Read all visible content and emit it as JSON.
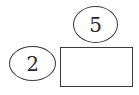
{
  "diagram": {
    "nodes": [
      {
        "id": "top",
        "shape": "ellipse",
        "label": "5"
      },
      {
        "id": "left",
        "shape": "ellipse",
        "label": "2"
      },
      {
        "id": "box",
        "shape": "rectangle",
        "label": ""
      }
    ],
    "stroke_color": "#3a3a3a",
    "background": "#ffffff"
  }
}
